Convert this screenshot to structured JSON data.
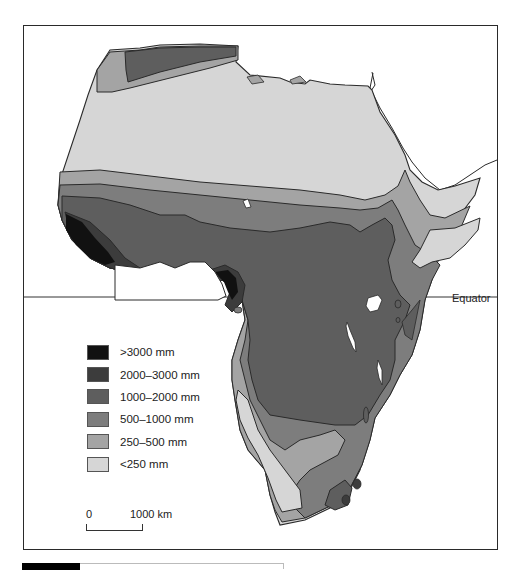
{
  "map": {
    "title": "Africa mean annual rainfall",
    "equator_label": "Equator",
    "colors": {
      "gt3000": "#111111",
      "r2000_3000": "#3c3c3c",
      "r1000_2000": "#5e5e5e",
      "r500_1000": "#7d7d7d",
      "r250_500": "#a4a4a4",
      "lt250": "#d6d6d6",
      "lakes": "#ffffff",
      "outline": "#2a2a2a"
    }
  },
  "legend": {
    "items": [
      {
        "label": ">3000 mm",
        "color": "#111111"
      },
      {
        "label": "2000–3000 mm",
        "color": "#3c3c3c"
      },
      {
        "label": "1000–2000 mm",
        "color": "#5e5e5e"
      },
      {
        "label": "500–1000 mm",
        "color": "#7d7d7d"
      },
      {
        "label": "250–500 mm",
        "color": "#a4a4a4"
      },
      {
        "label": "<250 mm",
        "color": "#d6d6d6"
      }
    ]
  },
  "scale_bar": {
    "start_label": "0",
    "end_label": "1000 km"
  }
}
